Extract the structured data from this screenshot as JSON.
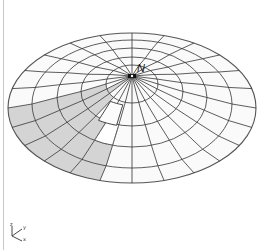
{
  "viewer": {
    "background": "#ffffff",
    "border_color": "#c8c8c8"
  },
  "dome": {
    "apex": {
      "x": 132,
      "y": 76
    },
    "rings": [
      {
        "rx": 26,
        "top": 65,
        "bottom": 103
      },
      {
        "rx": 51,
        "top": 57,
        "bottom": 126
      },
      {
        "rx": 75,
        "top": 48,
        "bottom": 147
      },
      {
        "rx": 100,
        "top": 40,
        "bottom": 168
      },
      {
        "rx": 124,
        "top": 33,
        "bottom": 183
      }
    ],
    "sector_count": 24,
    "line_color": "#333333",
    "rim_color": "#555555",
    "face_color": "#fafafa",
    "shaded_color": "#d4d4d4",
    "shaded_cells": [
      {
        "ring": 1,
        "sectors": [
          10
        ]
      },
      {
        "ring": 2,
        "sectors": [
          9,
          10,
          11
        ]
      },
      {
        "ring": 3,
        "sectors": [
          7,
          8,
          9,
          10,
          11
        ]
      },
      {
        "ring": 4,
        "sectors": [
          7,
          8,
          9,
          10,
          11
        ]
      },
      {
        "ring": 5,
        "sectors": [
          7,
          8,
          9,
          10,
          11
        ]
      }
    ],
    "lifted_panel": {
      "ring": 3,
      "sector": 7,
      "offset": {
        "dx": 4,
        "dy": -20
      },
      "face_color": "#fbfbfb",
      "outline_dash": "1.5,1.5"
    },
    "apex_marker": {
      "label": "N",
      "label_x": 137,
      "label_y": 63
    }
  },
  "axis_triad": {
    "origin": {
      "x": 12,
      "y": 236
    },
    "axes": [
      {
        "name": "z",
        "label": "z",
        "dx": 0,
        "dy": -10
      },
      {
        "name": "y",
        "label": "y",
        "dx": 10,
        "dy": -7
      },
      {
        "name": "x",
        "label": "x",
        "dx": 10,
        "dy": 5
      }
    ]
  }
}
